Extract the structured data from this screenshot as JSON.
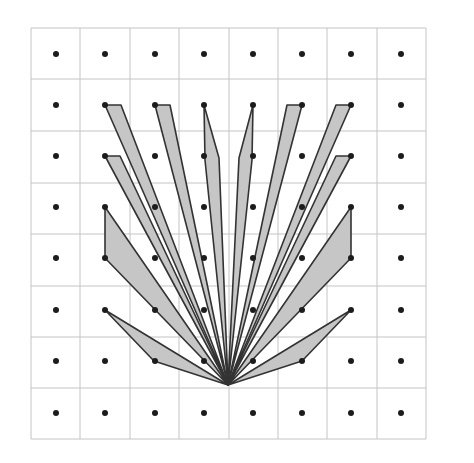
{
  "diagram": {
    "type": "lattice-fan",
    "grid": {
      "cols": 8,
      "rows": 8,
      "x_lines": [
        31,
        80,
        130,
        179,
        229,
        278,
        327,
        377,
        426
      ],
      "y_lines": [
        28,
        79,
        131,
        183,
        234,
        286,
        337,
        388,
        439
      ],
      "line_color": "#c4c4c4"
    },
    "dots": {
      "x_centers": [
        56,
        105,
        155,
        204,
        253,
        302,
        351,
        401
      ],
      "y_centers": [
        54,
        105,
        156,
        207,
        258,
        310,
        361,
        413
      ],
      "radius": 3,
      "color": "#1c1c1c"
    },
    "apex": [
      228,
      385
    ],
    "blade_fill": "#c6c6c6",
    "blade_stroke": "#333333",
    "blades": [
      {
        "id": "left-1",
        "points": "105,105 121,105 228,385"
      },
      {
        "id": "left-2",
        "points": "155,105 170,105 228,385"
      },
      {
        "id": "left-3",
        "points": "105,156 120,156 228,385"
      },
      {
        "id": "left-4",
        "points": "204,105 219,158 228,385 205,160"
      },
      {
        "id": "left-5",
        "points": "105,207 105,258 228,385"
      },
      {
        "id": "left-6",
        "points": "105,310 154,361 228,385"
      },
      {
        "id": "right-1",
        "points": "351,105 336,105 228,385"
      },
      {
        "id": "right-2",
        "points": "302,105 287,105 228,385"
      },
      {
        "id": "right-3",
        "points": "351,156 336,156 228,385"
      },
      {
        "id": "right-4",
        "points": "253,105 239,158 228,385 252,160"
      },
      {
        "id": "right-5",
        "points": "351,207 351,258 228,385"
      },
      {
        "id": "right-6",
        "points": "351,310 302,361 228,385"
      }
    ]
  }
}
